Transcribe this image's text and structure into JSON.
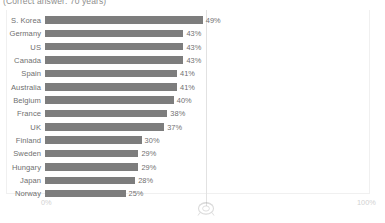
{
  "chart_data": {
    "type": "bar",
    "orientation": "horizontal",
    "title": "",
    "subtitle": "(Correct answer: 70 years)",
    "xlabel": "",
    "ylabel": "",
    "xlim": [
      0,
      100
    ],
    "grid": true,
    "gridlines": [
      50
    ],
    "legend": null,
    "categories": [
      "S. Korea",
      "Germany",
      "US",
      "Canada",
      "Spain",
      "Australia",
      "Belgium",
      "France",
      "UK",
      "Finland",
      "Sweden",
      "Hungary",
      "Japan",
      "Norway"
    ],
    "values": [
      49,
      43,
      43,
      43,
      41,
      41,
      40,
      38,
      37,
      30,
      29,
      29,
      28,
      25
    ],
    "value_labels": [
      "49%",
      "43%",
      "43%",
      "43%",
      "41%",
      "41%",
      "40%",
      "38%",
      "37%",
      "30%",
      "29%",
      "29%",
      "28%",
      "25%"
    ],
    "axis_ticks": [
      {
        "value": 0,
        "label": "0%"
      },
      {
        "value": 100,
        "label": "100%"
      }
    ],
    "bar_color": "#7d7d7d",
    "gridline_color": "#e2e2e2",
    "axis_tick_color": "#d2d2d2",
    "label_color": "#6f6f6f"
  },
  "marker": {
    "name": "correct-answer-marker",
    "position_percent": 50
  }
}
